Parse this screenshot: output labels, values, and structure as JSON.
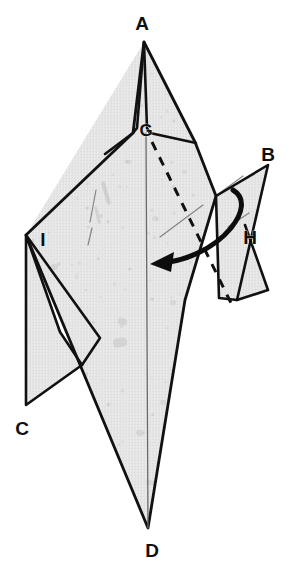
{
  "figure": {
    "type": "origami-folding-diagram",
    "background_color": "#ffffff",
    "paper_fill": "#e9e9e9",
    "paper_speckle_color": "#a8a8a8",
    "outline_color": "#111111",
    "fold_line_color": "#111111",
    "arrow_color": "#0d0d0d",
    "crease_line_color": "#6a6a6a"
  },
  "labels": [
    {
      "id": "A",
      "text": "A",
      "x": 142,
      "y": 25,
      "size": "normal"
    },
    {
      "id": "G",
      "text": "G",
      "x": 146,
      "y": 132,
      "size": "small"
    },
    {
      "id": "B",
      "text": "B",
      "x": 268,
      "y": 156,
      "size": "normal"
    },
    {
      "id": "I",
      "text": "I",
      "x": 43,
      "y": 241,
      "size": "normal"
    },
    {
      "id": "H",
      "text": "H",
      "x": 250,
      "y": 239,
      "size": "normal"
    },
    {
      "id": "C",
      "text": "C",
      "x": 22,
      "y": 430,
      "size": "normal"
    },
    {
      "id": "D",
      "text": "D",
      "x": 152,
      "y": 552,
      "size": "normal"
    }
  ],
  "shapes": {
    "main_body": {
      "name": "main-kite-body",
      "points": "144,42 133,133 26,235 148,528 185,300 216,196 195,142"
    },
    "left_spike_facet": {
      "name": "left-spike-facet",
      "points": "144,42 137,128 133,133 105,154"
    },
    "right_spike_facet": {
      "name": "right-spike-facet",
      "points": "144,42 147,128 150,133 196,143"
    },
    "upper_left_wing": {
      "name": "upper-left-wing-facet",
      "points": "144,42 133,133 26,235"
    },
    "upper_right_wing": {
      "name": "upper-right-wing-facet",
      "points": "144,42 150,133 218,195"
    },
    "left_lower_flap": {
      "name": "left-lower-flap-c",
      "points": "26,235 26,405 82,365 60,332"
    },
    "left_flap_inner": {
      "name": "left-flap-inner-facet",
      "points": "26,235 100,338 82,365"
    },
    "right_flap_b": {
      "name": "right-flap-b",
      "points": "268,165 237,300 219,298 216,196"
    },
    "right_flap_b_lower": {
      "name": "right-flap-b-lower-facet",
      "points": "245,225 268,290 237,300"
    }
  },
  "center_fold_line": {
    "name": "center-vertical-fold",
    "from": {
      "x": 146,
      "y": 133
    },
    "to": {
      "x": 148,
      "y": 528
    }
  },
  "dashed_fold_line": {
    "name": "valley-fold-dashed-line",
    "label": "dashed valley fold from G toward lower right",
    "from": {
      "x": 152,
      "y": 142
    },
    "to": {
      "x": 231,
      "y": 303
    },
    "dash_pattern": "9 8",
    "stroke_width": 3
  },
  "arrow": {
    "name": "fold-direction-arrow",
    "description": "thick curved arrow sweeping from the right flap B leftward across the body",
    "path": "M 233,190 C 246,198 243,213 231,228 C 213,250 183,262 158,263",
    "head_tip": {
      "x": 150,
      "y": 264
    },
    "stroke_width": 5,
    "color": "#0d0d0d"
  },
  "crease_marks": [
    {
      "name": "crease-left-long",
      "from": {
        "x": 96,
        "y": 190
      },
      "to": {
        "x": 90,
        "y": 222
      }
    },
    {
      "name": "crease-left-short",
      "from": {
        "x": 92,
        "y": 228
      },
      "to": {
        "x": 88,
        "y": 245
      }
    },
    {
      "name": "crease-mid",
      "from": {
        "x": 203,
        "y": 205
      },
      "to": {
        "x": 160,
        "y": 237
      }
    },
    {
      "name": "crease-b-tab",
      "from": {
        "x": 243,
        "y": 176
      },
      "to": {
        "x": 217,
        "y": 195
      }
    },
    {
      "name": "crease-h-tab",
      "from": {
        "x": 249,
        "y": 213
      },
      "to": {
        "x": 228,
        "y": 227
      }
    }
  ],
  "speckles": [
    {
      "x": 104,
      "y": 181,
      "w": 4,
      "h": 24,
      "r": 2,
      "rot": -16,
      "o": 0.34
    },
    {
      "x": 96,
      "y": 206,
      "w": 3,
      "h": 18,
      "r": 2,
      "rot": -14,
      "o": 0.3
    },
    {
      "x": 66,
      "y": 187,
      "w": 5,
      "h": 5,
      "r": 2,
      "rot": 0,
      "o": 0.26
    },
    {
      "x": 51,
      "y": 264,
      "w": 7,
      "h": 6,
      "r": 3,
      "rot": 12,
      "o": 0.25
    },
    {
      "x": 118,
      "y": 318,
      "w": 9,
      "h": 7,
      "r": 3,
      "rot": 20,
      "o": 0.26
    },
    {
      "x": 113,
      "y": 338,
      "w": 14,
      "h": 9,
      "r": 4,
      "rot": -10,
      "o": 0.28
    },
    {
      "x": 60,
      "y": 322,
      "w": 6,
      "h": 5,
      "r": 2,
      "rot": 0,
      "o": 0.22
    },
    {
      "x": 72,
      "y": 365,
      "w": 7,
      "h": 5,
      "r": 2,
      "rot": 8,
      "o": 0.24
    },
    {
      "x": 170,
      "y": 300,
      "w": 6,
      "h": 5,
      "r": 2,
      "rot": 0,
      "o": 0.22
    },
    {
      "x": 196,
      "y": 280,
      "w": 8,
      "h": 5,
      "r": 2,
      "rot": -24,
      "o": 0.24
    },
    {
      "x": 213,
      "y": 272,
      "w": 12,
      "h": 5,
      "r": 2,
      "rot": -28,
      "o": 0.22
    },
    {
      "x": 160,
      "y": 400,
      "w": 6,
      "h": 5,
      "r": 2,
      "rot": 0,
      "o": 0.22
    },
    {
      "x": 136,
      "y": 430,
      "w": 8,
      "h": 6,
      "r": 3,
      "rot": 14,
      "o": 0.24
    },
    {
      "x": 175,
      "y": 455,
      "w": 5,
      "h": 5,
      "r": 2,
      "rot": 0,
      "o": 0.2
    },
    {
      "x": 146,
      "y": 480,
      "w": 9,
      "h": 5,
      "r": 2,
      "rot": 10,
      "o": 0.22
    },
    {
      "x": 152,
      "y": 216,
      "w": 6,
      "h": 5,
      "r": 2,
      "rot": 0,
      "o": 0.2
    },
    {
      "x": 126,
      "y": 160,
      "w": 6,
      "h": 4,
      "r": 2,
      "rot": -18,
      "o": 0.22
    },
    {
      "x": 182,
      "y": 170,
      "w": 5,
      "h": 4,
      "r": 2,
      "rot": 0,
      "o": 0.2
    },
    {
      "x": 228,
      "y": 330,
      "w": 7,
      "h": 5,
      "r": 2,
      "rot": 16,
      "o": 0.22
    },
    {
      "x": 205,
      "y": 370,
      "w": 6,
      "h": 4,
      "r": 2,
      "rot": 0,
      "o": 0.2
    },
    {
      "x": 243,
      "y": 205,
      "w": 5,
      "h": 4,
      "r": 2,
      "rot": 0,
      "o": 0.2
    },
    {
      "x": 254,
      "y": 250,
      "w": 6,
      "h": 4,
      "r": 2,
      "rot": -12,
      "o": 0.2
    },
    {
      "x": 40,
      "y": 300,
      "w": 5,
      "h": 4,
      "r": 2,
      "rot": 0,
      "o": 0.18
    },
    {
      "x": 88,
      "y": 390,
      "w": 6,
      "h": 4,
      "r": 2,
      "rot": 0,
      "o": 0.18
    },
    {
      "x": 190,
      "y": 500,
      "w": 5,
      "h": 4,
      "r": 2,
      "rot": 0,
      "o": 0.18
    }
  ]
}
